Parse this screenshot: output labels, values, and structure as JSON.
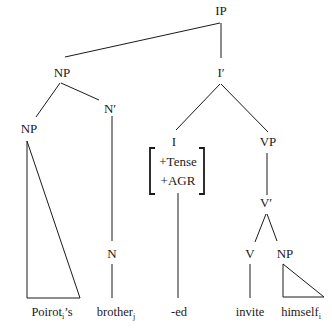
{
  "diagram": {
    "type": "syntax-tree",
    "nodes": {
      "ip": "IP",
      "np_subject": "NP",
      "i_bar": "I′",
      "np_possessor": "NP",
      "n_bar": "N′",
      "i_head": "I",
      "vp": "VP",
      "n_head": "N",
      "v_bar": "V′",
      "v_head": "V",
      "np_object": "NP"
    },
    "features": [
      "+Tense",
      "+AGR"
    ],
    "leaves": {
      "possessor": {
        "word": "Poirot",
        "index": "i",
        "suffix": "’s"
      },
      "noun": {
        "word": "brother",
        "index": "j",
        "suffix": ""
      },
      "tense": {
        "word": "-ed",
        "index": "",
        "suffix": ""
      },
      "verb": {
        "word": "invite",
        "index": "",
        "suffix": ""
      },
      "object": {
        "word": "himself",
        "index": "i",
        "suffix": ""
      }
    }
  }
}
